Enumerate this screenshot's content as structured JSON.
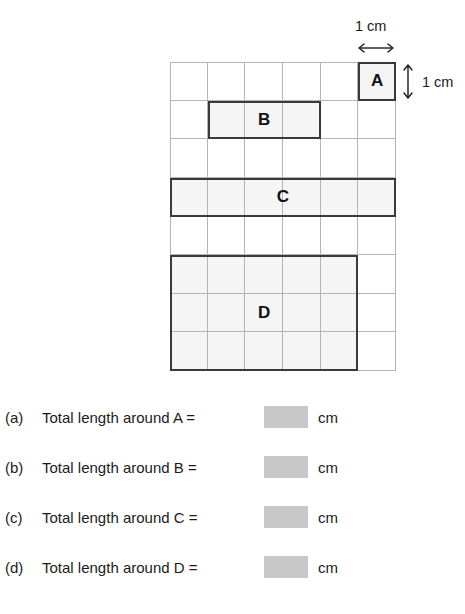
{
  "diagram": {
    "grid": {
      "columns": 6,
      "rows": 8,
      "cell_size_label": "1 cm"
    },
    "dimension_labels": {
      "top": "1 cm",
      "right": "1 cm"
    },
    "icons": {
      "horizontal_measure": "double-arrow-horizontal-icon",
      "vertical_measure": "double-arrow-vertical-icon"
    },
    "shapes": [
      {
        "label": "A",
        "col": 6,
        "row": 1,
        "width_cells": 1,
        "height_cells": 1
      },
      {
        "label": "B",
        "col": 2,
        "row": 2,
        "width_cells": 3,
        "height_cells": 1
      },
      {
        "label": "C",
        "col": 1,
        "row": 4,
        "width_cells": 6,
        "height_cells": 1
      },
      {
        "label": "D",
        "col": 1,
        "row": 6,
        "width_cells": 5,
        "height_cells": 3
      }
    ]
  },
  "questions": [
    {
      "marker": "(a)",
      "text": "Total length around A =",
      "answer": "",
      "unit": "cm"
    },
    {
      "marker": "(b)",
      "text": "Total length around B =",
      "answer": "",
      "unit": "cm"
    },
    {
      "marker": "(c)",
      "text": "Total length around C =",
      "answer": "",
      "unit": "cm"
    },
    {
      "marker": "(d)",
      "text": "Total length around D =",
      "answer": "",
      "unit": "cm"
    }
  ],
  "colors": {
    "gridline": "#b4b4b4",
    "shape_border": "#3a3a3a",
    "answer_box": "#c8c8c8",
    "text": "#1b1b1b"
  }
}
